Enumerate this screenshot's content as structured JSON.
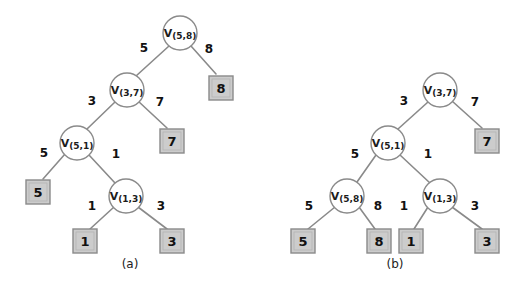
{
  "figure": {
    "background_color": "#ffffff",
    "line_color": "#8a8a8a",
    "leaf_fill_color": "#cccccc",
    "text_color": "#111111",
    "panels": [
      {
        "id": "panel-a",
        "caption": "(a)",
        "caption_x": 130,
        "caption_y": 268,
        "internal_nodes": [
          {
            "id": "a-n1",
            "main": "V",
            "sub": "(5,8)",
            "cx": 180,
            "cy": 33,
            "r": 17
          },
          {
            "id": "a-n2",
            "main": "V",
            "sub": "(3,7)",
            "cx": 127,
            "cy": 90,
            "r": 17
          },
          {
            "id": "a-n3",
            "main": "V",
            "sub": "(5,1)",
            "cx": 77,
            "cy": 143,
            "r": 17
          },
          {
            "id": "a-n4",
            "main": "V",
            "sub": "(1,3)",
            "cx": 126,
            "cy": 196,
            "r": 17
          }
        ],
        "leaves": [
          {
            "id": "a-l8",
            "value": "8",
            "cx": 221,
            "cy": 88,
            "w": 24,
            "h": 24
          },
          {
            "id": "a-l7",
            "value": "7",
            "cx": 172,
            "cy": 141,
            "w": 24,
            "h": 24
          },
          {
            "id": "a-l5",
            "value": "5",
            "cx": 38,
            "cy": 192,
            "w": 24,
            "h": 24
          },
          {
            "id": "a-l1",
            "value": "1",
            "cx": 85,
            "cy": 241,
            "w": 24,
            "h": 24
          },
          {
            "id": "a-l3",
            "value": "3",
            "cx": 172,
            "cy": 241,
            "w": 24,
            "h": 24
          }
        ],
        "edges": [
          {
            "id": "a-e1",
            "from": "a-n1",
            "to": "a-n2",
            "x1": 169,
            "y1": 46,
            "x2": 136,
            "y2": 76,
            "weight": "5",
            "lx": 144,
            "ly": 52
          },
          {
            "id": "a-e2",
            "from": "a-n1",
            "to": "a-l8",
            "x1": 191,
            "y1": 46,
            "x2": 216,
            "y2": 74,
            "weight": "8",
            "lx": 209,
            "ly": 53
          },
          {
            "id": "a-e3",
            "from": "a-n2",
            "to": "a-n3",
            "x1": 115,
            "y1": 102,
            "x2": 87,
            "y2": 129,
            "weight": "3",
            "lx": 92,
            "ly": 105
          },
          {
            "id": "a-e4",
            "from": "a-n2",
            "to": "a-l7",
            "x1": 138,
            "y1": 101,
            "x2": 167,
            "y2": 128,
            "weight": "7",
            "lx": 160,
            "ly": 106
          },
          {
            "id": "a-e5",
            "from": "a-n3",
            "to": "a-l5",
            "x1": 65,
            "y1": 154,
            "x2": 43,
            "y2": 179,
            "weight": "5",
            "lx": 44,
            "ly": 157
          },
          {
            "id": "a-e6",
            "from": "a-n3",
            "to": "a-n4",
            "x1": 89,
            "y1": 155,
            "x2": 115,
            "y2": 183,
            "weight": "1",
            "lx": 116,
            "ly": 158
          },
          {
            "id": "a-e7",
            "from": "a-n4",
            "to": "a-l1",
            "x1": 114,
            "y1": 207,
            "x2": 90,
            "y2": 229,
            "weight": "1",
            "lx": 92,
            "ly": 210
          },
          {
            "id": "a-e8",
            "from": "a-n4",
            "to": "a-l3",
            "x1": 138,
            "y1": 207,
            "x2": 167,
            "y2": 229,
            "weight": "3",
            "lx": 161,
            "ly": 210
          }
        ]
      },
      {
        "id": "panel-b",
        "caption": "(b)",
        "caption_x": 395,
        "caption_y": 268,
        "internal_nodes": [
          {
            "id": "b-n1",
            "main": "V",
            "sub": "(3,7)",
            "cx": 440,
            "cy": 90,
            "r": 17
          },
          {
            "id": "b-n2",
            "main": "V",
            "sub": "(5,1)",
            "cx": 388,
            "cy": 143,
            "r": 17
          },
          {
            "id": "b-n3",
            "main": "V",
            "sub": "(5,8)",
            "cx": 347,
            "cy": 196,
            "r": 17
          },
          {
            "id": "b-n4",
            "main": "V",
            "sub": "(1,3)",
            "cx": 440,
            "cy": 196,
            "r": 17
          }
        ],
        "leaves": [
          {
            "id": "b-l7",
            "value": "7",
            "cx": 487,
            "cy": 141,
            "w": 24,
            "h": 24
          },
          {
            "id": "b-l5",
            "value": "5",
            "cx": 303,
            "cy": 241,
            "w": 24,
            "h": 24
          },
          {
            "id": "b-l8",
            "value": "8",
            "cx": 379,
            "cy": 241,
            "w": 24,
            "h": 24
          },
          {
            "id": "b-l1",
            "value": "1",
            "cx": 411,
            "cy": 241,
            "w": 24,
            "h": 24
          },
          {
            "id": "b-l3",
            "value": "3",
            "cx": 487,
            "cy": 241,
            "w": 24,
            "h": 24
          }
        ],
        "edges": [
          {
            "id": "b-e1",
            "from": "b-n1",
            "to": "b-n2",
            "x1": 428,
            "y1": 102,
            "x2": 398,
            "y2": 129,
            "weight": "3",
            "lx": 404,
            "ly": 105
          },
          {
            "id": "b-e2",
            "from": "b-n1",
            "to": "b-l7",
            "x1": 452,
            "y1": 101,
            "x2": 482,
            "y2": 128,
            "weight": "7",
            "lx": 475,
            "ly": 106
          },
          {
            "id": "b-e3",
            "from": "b-n2",
            "to": "b-n3",
            "x1": 376,
            "y1": 155,
            "x2": 357,
            "y2": 182,
            "weight": "5",
            "lx": 355,
            "ly": 158
          },
          {
            "id": "b-e4",
            "from": "b-n2",
            "to": "b-n4",
            "x1": 400,
            "y1": 155,
            "x2": 430,
            "y2": 183,
            "weight": "1",
            "lx": 428,
            "ly": 158
          },
          {
            "id": "b-e5",
            "from": "b-n3",
            "to": "b-l5",
            "x1": 335,
            "y1": 207,
            "x2": 308,
            "y2": 229,
            "weight": "5",
            "lx": 309,
            "ly": 210
          },
          {
            "id": "b-e6",
            "from": "b-n3",
            "to": "b-l8",
            "x1": 359,
            "y1": 207,
            "x2": 375,
            "y2": 229,
            "weight": "8",
            "lx": 378,
            "ly": 210
          },
          {
            "id": "b-e7",
            "from": "b-n4",
            "to": "b-l1",
            "x1": 428,
            "y1": 207,
            "x2": 414,
            "y2": 229,
            "weight": "1",
            "lx": 404,
            "ly": 210
          },
          {
            "id": "b-e8",
            "from": "b-n4",
            "to": "b-l3",
            "x1": 452,
            "y1": 207,
            "x2": 482,
            "y2": 229,
            "weight": "3",
            "lx": 475,
            "ly": 210
          }
        ]
      }
    ]
  }
}
